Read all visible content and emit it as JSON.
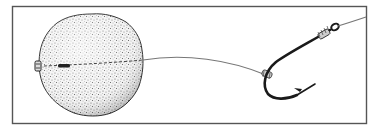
{
  "illustration": {
    "subject": "Fishing hair rig: round bait (boilie) threaded on a hair attached to a hook",
    "elements": {
      "frame": "rectangular border",
      "bait": "stippled round boilie",
      "hair": "dashed line through bait with stop at left end",
      "hooklength": "line from bait to hook shank",
      "hook": "curved barbed fishing hook with whipped eye",
      "main_line": "line exiting hook eye to upper right"
    },
    "colors": {
      "ink": "#1a1a1a",
      "frame": "#555555",
      "line": "#777777",
      "background": "#ffffff"
    }
  }
}
